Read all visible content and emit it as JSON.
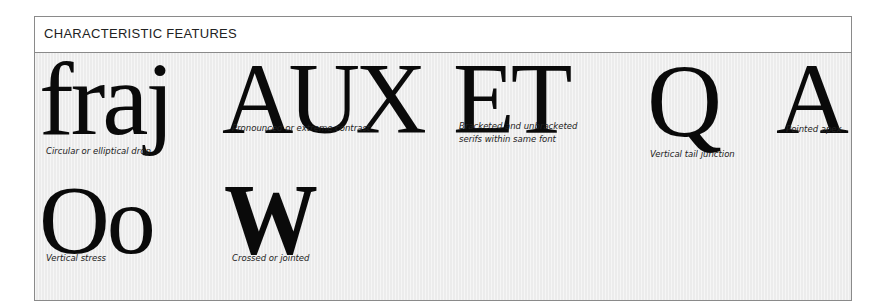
{
  "panel": {
    "title": "CHARACTERISTIC FEATURES"
  },
  "features": [
    {
      "glyphs": "fraj",
      "caption": "Circular or elliptical drop"
    },
    {
      "glyphs": "AUX",
      "caption": "Pronounced or extreme contrast"
    },
    {
      "glyphs": "ET",
      "caption_lines": [
        "Bracketed and unbracketed",
        "serifs within same font"
      ]
    },
    {
      "glyphs": "Q",
      "caption": "Vertical tail junction"
    },
    {
      "glyphs": "A",
      "caption": "Pointed apex"
    },
    {
      "glyphs": "Oo",
      "caption": "Vertical stress"
    },
    {
      "glyphs": "W",
      "caption": "Crossed or jointed"
    }
  ],
  "colors": {
    "border": "#8a8a8a",
    "body_bg": "#ececec",
    "glyph": "#0a0a0a"
  }
}
